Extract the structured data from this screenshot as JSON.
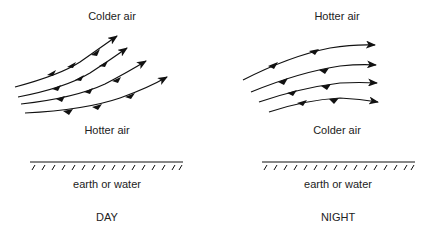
{
  "day": {
    "top_label": "Colder air",
    "bottom_label": "Hotter air",
    "ground_label": "earth or water",
    "caption": "DAY"
  },
  "night": {
    "top_label": "Hotter air",
    "bottom_label": "Colder air",
    "ground_label": "earth or water",
    "caption": "NIGHT"
  },
  "colors": {
    "ink": "#111111",
    "background": "#ffffff"
  }
}
